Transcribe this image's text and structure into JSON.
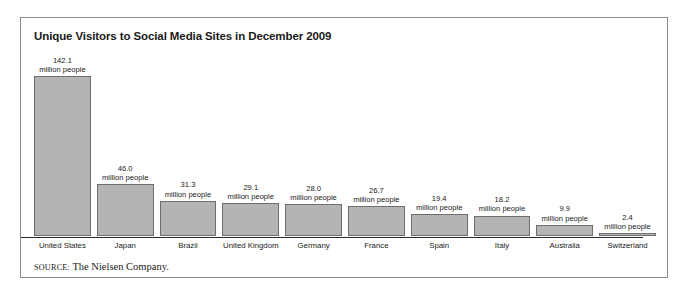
{
  "figure": {
    "title": "Unique Visitors to Social Media Sites in December 2009",
    "source_label": "SOURCE:",
    "source_text": " The Nielsen Company.",
    "bar_fill_color": "#b4b4b4",
    "bar_border_color": "#6e6e6e",
    "frame_color": "#8a8a8a",
    "axis_color": "#2a2a2a"
  },
  "chart_data": {
    "type": "bar",
    "title": "Unique Visitors to Social Media Sites in December 2009",
    "xlabel": "",
    "ylabel": "",
    "unit": "million people",
    "ylim": [
      0,
      142.1
    ],
    "grid": false,
    "legend": "none",
    "categories": [
      "United States",
      "Japan",
      "Brazil",
      "United Kingdom",
      "Germany",
      "France",
      "Spain",
      "Italy",
      "Australia",
      "Switzerland"
    ],
    "values": [
      142.1,
      46.0,
      31.3,
      29.1,
      28.0,
      26.7,
      19.4,
      18.2,
      9.9,
      2.4
    ],
    "value_labels": [
      "142.1",
      "46.0",
      "31.3",
      "29.1",
      "28.0",
      "26.7",
      "19.4",
      "18.2",
      "9.9",
      "2.4"
    ],
    "unit_labels": [
      "million people",
      "million people",
      "million people",
      "million people",
      "million people",
      "million people",
      "million people",
      "million people",
      "million people",
      "million people"
    ]
  }
}
